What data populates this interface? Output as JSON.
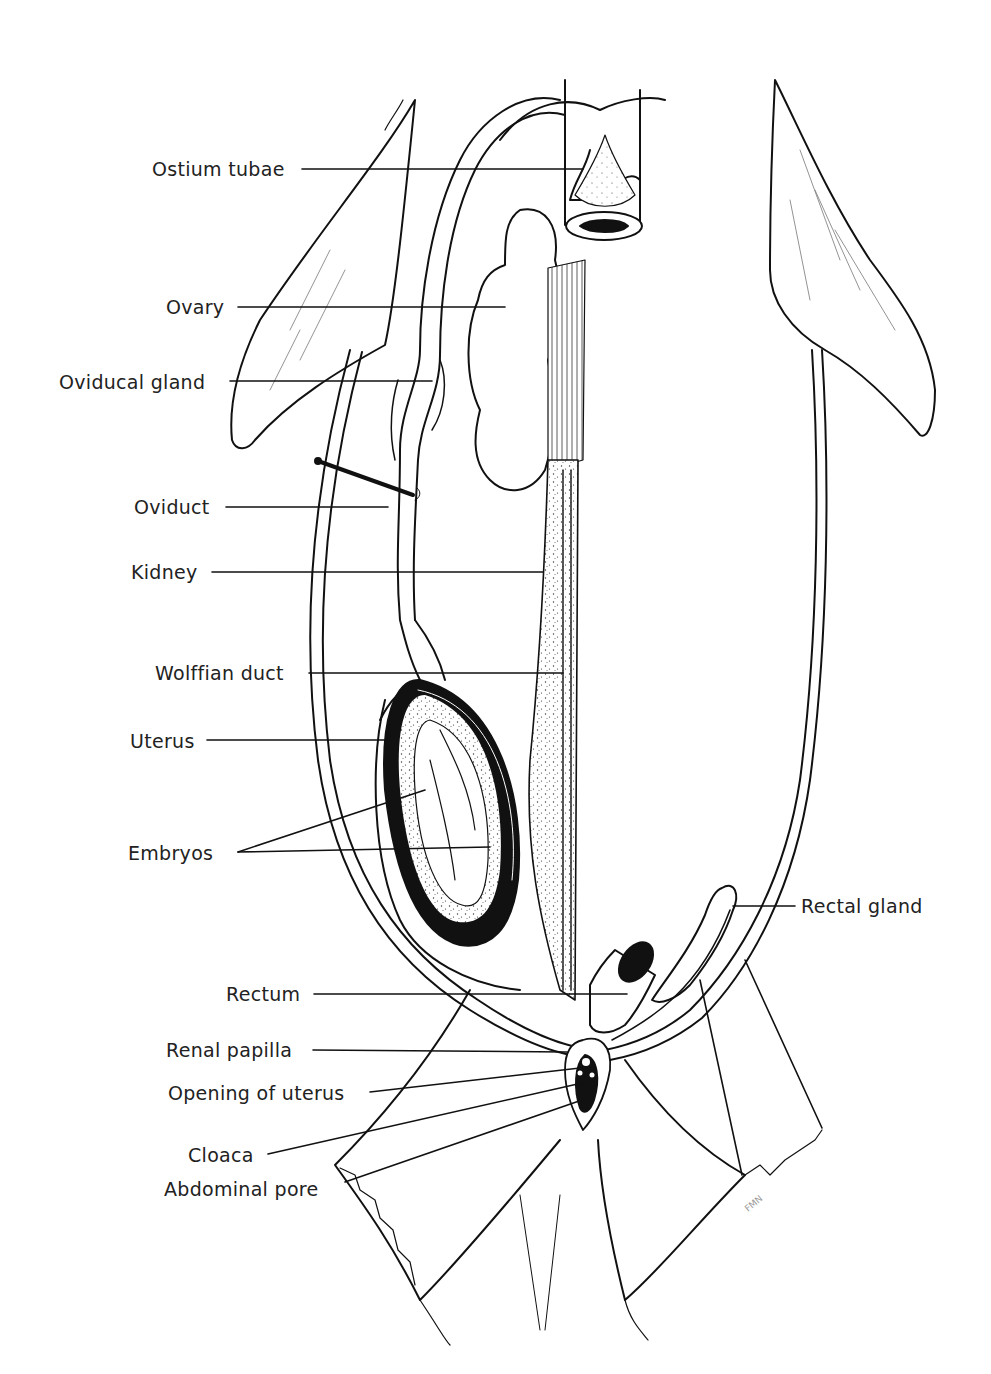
{
  "diagram": {
    "labels": {
      "ostium_tubae": "Ostium tubae",
      "ovary": "Ovary",
      "oviducal_gland": "Oviducal gland",
      "oviduct": "Oviduct",
      "kidney": "Kidney",
      "wolffian_duct": "Wolffian duct",
      "uterus": "Uterus",
      "embryos": "Embryos",
      "rectal_gland": "Rectal gland",
      "rectum": "Rectum",
      "renal_papilla": "Renal papilla",
      "opening_of_uterus": "Opening of uterus",
      "cloaca": "Cloaca",
      "abdominal_pore": "Abdominal pore"
    },
    "signature": "FMN"
  }
}
